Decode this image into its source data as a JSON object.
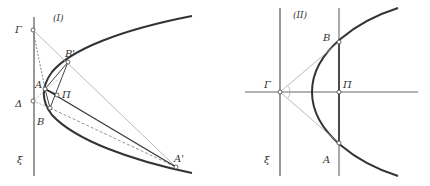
{
  "figures": [
    {
      "id": "I",
      "title": "(I)",
      "labels": {
        "gamma": "Γ",
        "delta": "Δ",
        "xi": "ξ",
        "a": "A",
        "b": "B",
        "a_prime": "A'",
        "b_prime": "B'",
        "pi": "Π"
      }
    },
    {
      "id": "II",
      "title": "(II)",
      "labels": {
        "gamma": "Γ",
        "xi": "ξ",
        "a": "A",
        "b": "B",
        "pi": "Π"
      }
    }
  ],
  "colors": {
    "curve": "#333333",
    "line": "#555555",
    "light_line": "#aaaaaa",
    "point_fill": "#ffffff"
  }
}
